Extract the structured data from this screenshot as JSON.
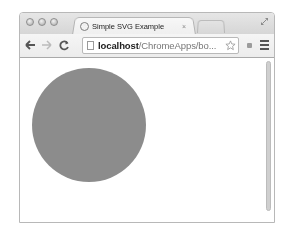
{
  "window": {
    "traffic_lights": [
      "close",
      "minimize",
      "zoom"
    ],
    "fullscreen_icon": "fullscreen-arrows-icon"
  },
  "tabs": [
    {
      "title": "Simple SVG Example",
      "favicon": "loading-spinner-icon",
      "close_label": "×",
      "active": true
    }
  ],
  "toolbar": {
    "back_icon": "←",
    "forward_icon": "→",
    "reload_icon": "C",
    "url_host": "localhost",
    "url_path": "/ChromeApps/bo...",
    "bookmark_icon": "star-icon",
    "menu_icon": "hamburger-menu-icon"
  },
  "page": {
    "svg": {
      "circle": {
        "cx": 69,
        "cy": 67,
        "r": 57,
        "fill": "#8c8c8c"
      }
    }
  },
  "colors": {
    "chrome_frame": "#d9d9d9",
    "circle_fill": "#8c8c8c"
  }
}
